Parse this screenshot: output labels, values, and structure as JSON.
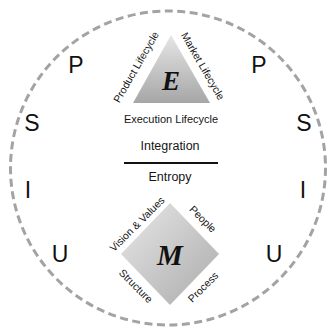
{
  "diagram": {
    "outer_ring": {
      "style": "dashed",
      "color": "#a3a3a3",
      "letters_left": [
        "P",
        "S",
        "I",
        "U"
      ],
      "letters_right": [
        "P",
        "S",
        "I",
        "U"
      ]
    },
    "execution_triangle": {
      "letter": "E",
      "left_edge_label": "Product Lifecycle",
      "right_edge_label": "Market Lifecycle",
      "base_label": "Execution Lifecycle",
      "gradient_top": "#e6e6e6",
      "gradient_bottom": "#a6a6a6"
    },
    "ratio": {
      "numerator": "Integration",
      "denominator": "Entropy"
    },
    "management_diamond": {
      "letter": "M",
      "top_left_label": "Vision & Values",
      "top_right_label": "People",
      "bottom_left_label": "Structure",
      "bottom_right_label": "Process",
      "gradient_light": "#e8e8e8",
      "gradient_dark": "#ababab"
    }
  }
}
